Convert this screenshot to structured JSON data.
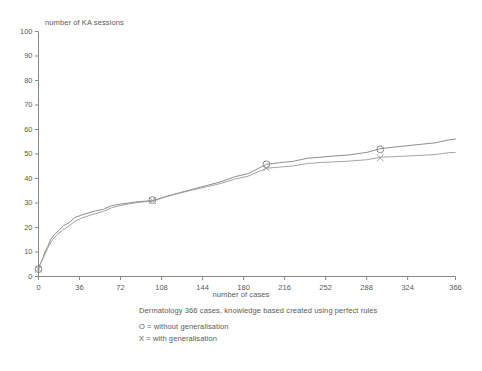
{
  "chart_data": {
    "type": "line",
    "title": "",
    "xlabel": "number of cases",
    "ylabel": "number of KA sessions",
    "xlim": [
      0,
      366
    ],
    "ylim": [
      0,
      100
    ],
    "grid": false,
    "legend_position": "below-plot",
    "xticks": [
      0,
      36,
      72,
      108,
      144,
      180,
      216,
      252,
      288,
      324,
      366
    ],
    "yticks": [
      0,
      10,
      20,
      30,
      40,
      50,
      60,
      70,
      80,
      90,
      100
    ],
    "xtick_labels": [
      "0",
      "36",
      "72",
      "108",
      "144",
      "180",
      "216",
      "252",
      "288",
      "324",
      "366"
    ],
    "ytick_labels": [
      "0",
      "10",
      "20",
      "30",
      "40",
      "50",
      "60",
      "70",
      "80",
      "90",
      "100"
    ],
    "series": [
      {
        "name": "without generalisation",
        "marker": "O",
        "color": "#808080",
        "x": [
          0,
          2,
          4,
          6,
          8,
          11,
          14,
          18,
          22,
          27,
          32,
          38,
          44,
          50,
          57,
          64,
          72,
          80,
          88,
          100,
          112,
          124,
          136,
          148,
          160,
          172,
          184,
          200,
          212,
          224,
          236,
          248,
          260,
          272,
          288,
          300,
          312,
          324,
          336,
          348,
          360,
          366
        ],
        "y": [
          3,
          5.5,
          8,
          10.5,
          12.5,
          15,
          17,
          19,
          20.8,
          22.3,
          23.8,
          25,
          26,
          26.9,
          27.7,
          28.6,
          29.4,
          30.1,
          30.7,
          31.2,
          32.4,
          34.1,
          35.7,
          37.3,
          38.9,
          40.4,
          41.9,
          45.8,
          46.6,
          47.3,
          48.0,
          48.6,
          49.2,
          49.7,
          50.9,
          51.9,
          52.7,
          53.4,
          54.1,
          54.8,
          55.5,
          56.0
        ],
        "markers": [
          {
            "x": 0,
            "y": 3
          },
          {
            "x": 100,
            "y": 31.2
          },
          {
            "x": 200,
            "y": 45.8
          },
          {
            "x": 300,
            "y": 51.9
          }
        ]
      },
      {
        "name": "with generalisation",
        "marker": "X",
        "color": "#9a9a9a",
        "x": [
          0,
          2,
          4,
          6,
          8,
          11,
          14,
          18,
          22,
          27,
          32,
          38,
          44,
          50,
          57,
          64,
          72,
          80,
          88,
          100,
          112,
          124,
          136,
          148,
          160,
          172,
          184,
          200,
          212,
          224,
          236,
          248,
          260,
          272,
          288,
          300,
          312,
          324,
          336,
          348,
          360,
          366
        ],
        "y": [
          3,
          5.2,
          7.4,
          9.6,
          11.6,
          13.9,
          15.8,
          17.8,
          19.4,
          20.9,
          22.4,
          23.7,
          24.8,
          25.8,
          26.8,
          27.8,
          28.8,
          29.7,
          30.4,
          31.0,
          32.3,
          33.9,
          35.4,
          36.8,
          38.2,
          39.5,
          40.8,
          44.2,
          44.8,
          45.4,
          45.9,
          46.4,
          46.8,
          47.2,
          47.9,
          48.4,
          48.8,
          49.2,
          49.6,
          50.0,
          50.3,
          50.5
        ],
        "markers": [
          {
            "x": 0,
            "y": 3
          },
          {
            "x": 100,
            "y": 31.0
          },
          {
            "x": 200,
            "y": 44.2
          },
          {
            "x": 300,
            "y": 48.4
          }
        ]
      }
    ],
    "caption": "Dermatology 366 cases, knowledge based created using perfect rules",
    "legend_entries": [
      "O = without generalisation",
      "X = with generalisation"
    ]
  },
  "colors": {
    "background": "#ffffff",
    "axis": "#888888",
    "text": "#5a5a5a",
    "series_o": "#808080",
    "series_x": "#9a9a9a"
  }
}
